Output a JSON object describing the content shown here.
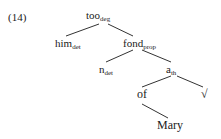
{
  "example_number": "(14)",
  "tree": {
    "nodes": [
      {
        "id": "too",
        "text": "too",
        "sub": "deg",
        "x": 86,
        "y": 9
      },
      {
        "id": "him",
        "text": "him",
        "sub": "det",
        "x": 55,
        "y": 37
      },
      {
        "id": "fond",
        "text": "fond",
        "sub": "prop",
        "x": 123,
        "y": 37
      },
      {
        "id": "n",
        "text": "n",
        "sub": "det",
        "x": 99,
        "y": 63
      },
      {
        "id": "a",
        "text": "a",
        "sub": "th",
        "x": 166,
        "y": 63
      },
      {
        "id": "of",
        "text": "of",
        "sub": "",
        "x": 137,
        "y": 88
      },
      {
        "id": "root",
        "text": "√",
        "sub": "",
        "x": 201,
        "y": 88
      },
      {
        "id": "mary",
        "text": "Mary",
        "sub": "",
        "x": 157,
        "y": 119
      }
    ],
    "edges": [
      [
        "too",
        "him"
      ],
      [
        "too",
        "fond"
      ],
      [
        "fond",
        "n"
      ],
      [
        "fond",
        "a"
      ],
      [
        "a",
        "of"
      ],
      [
        "a",
        "root"
      ],
      [
        "of",
        "mary"
      ]
    ]
  }
}
